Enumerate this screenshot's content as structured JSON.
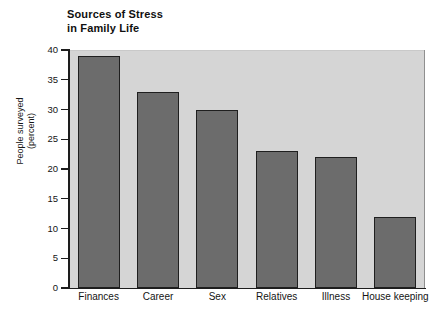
{
  "chart_data": {
    "type": "bar",
    "title": "Sources of Stress\nin Family Life",
    "title_line1": "Sources of Stress",
    "title_line2": "in Family Life",
    "xlabel": "",
    "ylabel": "People surveyed\n(percent)",
    "ylabel_line1": "People surveyed",
    "ylabel_line2": "(percent)",
    "categories": [
      "Finances",
      "Career",
      "Sex",
      "Relatives",
      "Illness",
      "House keeping"
    ],
    "values": [
      39,
      33,
      30,
      23,
      22,
      12
    ],
    "ylim": [
      0,
      40
    ],
    "ytick_labels": [
      "0",
      "5",
      "10",
      "15",
      "20",
      "25",
      "30",
      "35",
      "40"
    ],
    "ytick_values": [
      0,
      5,
      10,
      15,
      20,
      25,
      30,
      35,
      40
    ],
    "grid": false,
    "legend": "none",
    "bar_color": "#6c6c6c",
    "bar_edge_color": "#1f1f1f",
    "plot_background": "#d5d5d5",
    "figure_background": "#ffffff",
    "axis_color": "#1d1d1d"
  }
}
